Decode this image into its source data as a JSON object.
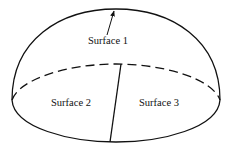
{
  "diagram": {
    "type": "hemisphere-surfaces",
    "labels": {
      "surface1": "Surface 1",
      "surface2": "Surface 2",
      "surface3": "Surface 3"
    },
    "colors": {
      "stroke": "#111111",
      "background": "#ffffff"
    }
  }
}
